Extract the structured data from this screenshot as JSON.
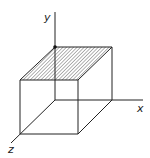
{
  "diagram": {
    "type": "3d-box-axes",
    "axes": {
      "x_label": "x",
      "y_label": "y",
      "z_label": "z"
    },
    "shaded_face": "top",
    "colors": {
      "stroke": "#222222",
      "hatch": "#555555",
      "background": "#ffffff"
    }
  }
}
